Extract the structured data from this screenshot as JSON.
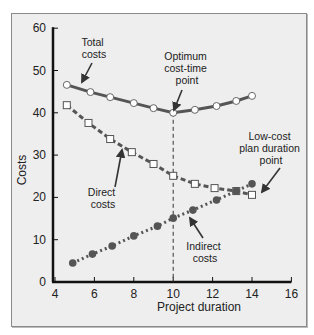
{
  "chart_data": {
    "type": "line",
    "title": "",
    "xlabel": "Project duration",
    "ylabel": "Costs",
    "xlim": [
      4,
      16
    ],
    "ylim": [
      0,
      60
    ],
    "x_ticks": [
      "4",
      "6",
      "8",
      "10",
      "12",
      "14",
      "16"
    ],
    "y_ticks": [
      "0",
      "10",
      "20",
      "30",
      "40",
      "50",
      "60"
    ],
    "grid": false,
    "legend": "none (inline annotations)",
    "series": [
      {
        "name": "Total costs",
        "style": "solid line, open circle markers",
        "x": [
          4.6,
          5.8,
          6.8,
          8.0,
          9.0,
          10.0,
          11.1,
          12.2,
          13.2,
          14.0
        ],
        "values": [
          46.6,
          44.9,
          43.7,
          42.3,
          41.1,
          40.0,
          40.7,
          41.6,
          42.8,
          44.0
        ]
      },
      {
        "name": "Direct costs",
        "style": "dashed line, open square markers",
        "x": [
          4.6,
          5.7,
          6.8,
          7.9,
          9.0,
          10.0,
          11.1,
          12.1,
          13.2,
          14.0
        ],
        "values": [
          41.8,
          37.6,
          33.8,
          30.7,
          27.9,
          25.1,
          23.2,
          22.2,
          21.5,
          20.6
        ]
      },
      {
        "name": "Indirect costs",
        "style": "dotted line, filled circle markers",
        "x": [
          4.9,
          5.9,
          6.9,
          8.0,
          9.2,
          10.0,
          11.0,
          12.2,
          13.2,
          14.0
        ],
        "values": [
          4.5,
          6.6,
          8.5,
          10.9,
          13.2,
          15.1,
          17.0,
          19.4,
          21.5,
          23.2
        ]
      }
    ],
    "annotations": [
      {
        "text": [
          "Total",
          "costs"
        ],
        "points_to": "Total costs curve near x=4.6"
      },
      {
        "text": [
          "Optimum",
          "cost-time",
          "point"
        ],
        "points_to": "Total cost minimum at x=10, y=40"
      },
      {
        "text": [
          "Direct",
          "costs"
        ],
        "points_to": "Direct costs curve near x=6.8"
      },
      {
        "text": [
          "Low-cost",
          "plan duration",
          "point"
        ],
        "points_to": "x=14 endpoint"
      },
      {
        "text": [
          "Indirect",
          "costs"
        ],
        "points_to": "Indirect costs curve near x=10.5"
      }
    ],
    "reference_lines": [
      {
        "type": "vertical dashed",
        "x": 10,
        "from_y": 0,
        "to_y": 40
      }
    ]
  },
  "labels": {
    "total": [
      "Total",
      "costs"
    ],
    "optimum": [
      "Optimum",
      "cost-time",
      "point"
    ],
    "direct": [
      "Direct",
      "costs"
    ],
    "lowcost": [
      "Low-cost",
      "plan duration",
      "point"
    ],
    "indirect": [
      "Indirect",
      "costs"
    ],
    "xlabel": "Project duration",
    "ylabel": "Costs"
  },
  "colors": {
    "frame_bg": "#eeeeee",
    "axis": "#111111",
    "series": "#555555"
  }
}
